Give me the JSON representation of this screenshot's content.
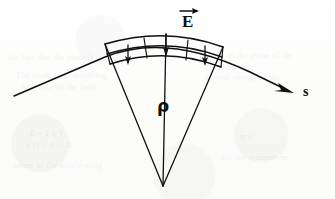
{
  "figure": {
    "kind": "physics-diagram",
    "width": 335,
    "height": 199,
    "background_color": "#fdfdfd",
    "ink_color": "#101010"
  },
  "labels": {
    "field": {
      "text": "E",
      "name": "electric-field-vector-label",
      "accent": "arrow-overbar",
      "x": 182,
      "y": 6
    },
    "radius": {
      "text": "ρ",
      "name": "radius-of-curvature-label",
      "x": 157,
      "y": 96
    },
    "arclength": {
      "text": "s",
      "name": "path-coordinate-label",
      "x": 303,
      "y": 84
    }
  },
  "geometry": {
    "apex": {
      "x": 163,
      "y": 186
    },
    "outer_arc": {
      "left_x": 105,
      "left_y": 44,
      "peak_x": 166,
      "peak_y": 34,
      "right_x": 223,
      "right_y": 47
    },
    "mid_arc": {
      "left_x": 107,
      "left_y": 54,
      "peak_x": 166,
      "peak_y": 44,
      "right_x": 222,
      "right_y": 56
    },
    "inner_arc": {
      "left_x": 110,
      "left_y": 64,
      "peak_x": 166,
      "peak_y": 54,
      "right_x": 221,
      "right_y": 66
    },
    "rays": [
      {
        "name": "left-wedge-edge",
        "top_x": 105,
        "top_y": 44
      },
      {
        "name": "center-radius-ray",
        "top_x": 166,
        "top_y": 34
      },
      {
        "name": "right-wedge-edge",
        "top_x": 223,
        "top_y": 47
      }
    ],
    "field_arrows": [
      {
        "name": "field-arrow-left",
        "x": 128,
        "y_from": 45,
        "y_to": 64
      },
      {
        "name": "field-arrow-center",
        "x": 166,
        "y_from": 34,
        "y_to": 56
      },
      {
        "name": "field-arrow-right",
        "x": 205,
        "y_from": 46,
        "y_to": 65
      }
    ],
    "trajectory": {
      "name": "beam-trajectory-curve",
      "start_x": 14,
      "start_y": 96,
      "end_x": 294,
      "end_y": 93,
      "arrowhead_at": "end"
    }
  },
  "ghost_bleed_text": [
    {
      "text": "the fact that the particle",
      "x": 8,
      "y": 52
    },
    {
      "text": "motion in the plane of the",
      "x": 200,
      "y": 50
    },
    {
      "text": "for the",
      "x": 226,
      "y": 62
    },
    {
      "text": "The small term involving",
      "x": 16,
      "y": 70
    },
    {
      "text": "kinetic energy of the",
      "x": 206,
      "y": 72
    },
    {
      "text": "the force of the field",
      "x": 22,
      "y": 82
    },
    {
      "text": "1",
      "x": 232,
      "y": 122
    },
    {
      "text": "E + 2 q V",
      "x": 30,
      "y": 128
    },
    {
      "text": "m c",
      "x": 240,
      "y": 131
    },
    {
      "text": "p (1 + 2 e) B",
      "x": 26,
      "y": 140
    },
    {
      "text": "for the momentum",
      "x": 222,
      "y": 152
    },
    {
      "text": "terms of the accelerating",
      "x": 14,
      "y": 160
    }
  ]
}
